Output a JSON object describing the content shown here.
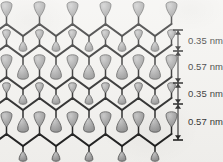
{
  "figure": {
    "name": "layered-lamellar-structure",
    "background_color": "#f3f2ef",
    "width": 223,
    "height": 162
  },
  "colors": {
    "line": "#1a1a1a",
    "head_fill": "#a0a0a0",
    "head_stroke": "#4d4d4d",
    "text": "#1d1d1d",
    "scalebar": "#1a1a1a"
  },
  "scale_bar": {
    "name": "dimension-scale-bar",
    "x": 178,
    "top": 30,
    "bottom": 140,
    "tick_half_width": 5,
    "ticks": [
      30,
      51,
      83,
      104,
      140
    ],
    "labels": [
      {
        "text": "0.35 nm",
        "x": 188,
        "y": 36
      },
      {
        "text": "0.57 nm",
        "x": 188,
        "y": 62
      },
      {
        "text": "0.35 nm",
        "x": 188,
        "y": 89
      },
      {
        "text": "0.57 nm",
        "x": 188,
        "y": 117
      }
    ],
    "segments": [
      {
        "label": "0.35 nm",
        "from": 30,
        "to": 51
      },
      {
        "label": "0.57 nm",
        "from": 51,
        "to": 83
      },
      {
        "label": "0.35 nm",
        "from": 83,
        "to": 104
      },
      {
        "label": "0.57 nm",
        "from": 104,
        "to": 140
      }
    ]
  },
  "lattice": {
    "zigzag_rows_y": [
      30,
      51,
      83,
      104,
      140
    ],
    "period": 33,
    "amplitude": 6,
    "x_start": -10,
    "x_end": 180,
    "stroke_width": 2.1
  },
  "head_groups": {
    "large": {
      "rx": 5.6,
      "ry": 8.0,
      "stem": 7
    },
    "small": {
      "rx": 4.0,
      "ry": 5.4,
      "stem": 5
    }
  }
}
